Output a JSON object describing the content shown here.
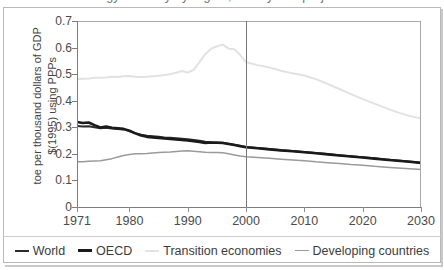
{
  "figure": {
    "title": "Energy intensity by region, history and projections",
    "title_visible_fragment": ""
  },
  "axes": {
    "y_title_line1": "toe per thousand dollars of GDP",
    "y_title_line2": "$(1995) using PPPs",
    "y_ticks": [
      "0.7",
      "0.6",
      "0.5",
      "0.4",
      "0.3",
      "0.2",
      "0.1",
      "0"
    ],
    "x_ticks": [
      "1971",
      "1980",
      "1990",
      "2000",
      "2010",
      "2020",
      "2030"
    ],
    "divider_year": "2000"
  },
  "legend": {
    "items": [
      {
        "label": "World",
        "color": "#2b2b2b"
      },
      {
        "label": "OECD",
        "color": "#1a1a1a"
      },
      {
        "label": "Transition economies",
        "color": "#e2e2e2"
      },
      {
        "label": "Developing countries",
        "color": "#9a9a9a"
      }
    ]
  },
  "chart_data": {
    "type": "line",
    "title": "Energy intensity by region, history and projections",
    "xlabel": "",
    "ylabel": "toe per thousand dollars of GDP $(1995) using PPPs",
    "xlim": [
      1971,
      2030
    ],
    "ylim": [
      0,
      0.7
    ],
    "ytick_step": 0.1,
    "grid": false,
    "legend_position": "bottom",
    "annotations": [
      {
        "type": "vline",
        "x": 2000,
        "note": "history / projection divider"
      }
    ],
    "x": [
      1971,
      1972,
      1973,
      1974,
      1975,
      1976,
      1977,
      1978,
      1979,
      1980,
      1981,
      1982,
      1983,
      1984,
      1985,
      1986,
      1987,
      1988,
      1989,
      1990,
      1991,
      1992,
      1993,
      1994,
      1995,
      1996,
      1997,
      1998,
      1999,
      2000,
      2002,
      2004,
      2006,
      2008,
      2010,
      2012,
      2014,
      2016,
      2018,
      2020,
      2022,
      2024,
      2026,
      2028,
      2030
    ],
    "series": [
      {
        "name": "World",
        "color": "#2b2b2b",
        "width": 2.0,
        "values": [
          0.305,
          0.303,
          0.304,
          0.3,
          0.296,
          0.298,
          0.295,
          0.294,
          0.292,
          0.286,
          0.278,
          0.272,
          0.268,
          0.266,
          0.264,
          0.262,
          0.261,
          0.259,
          0.257,
          0.255,
          0.252,
          0.249,
          0.246,
          0.244,
          0.243,
          0.242,
          0.238,
          0.234,
          0.23,
          0.226,
          0.222,
          0.218,
          0.214,
          0.211,
          0.207,
          0.203,
          0.199,
          0.195,
          0.191,
          0.187,
          0.183,
          0.179,
          0.175,
          0.171,
          0.167
        ]
      },
      {
        "name": "OECD",
        "color": "#1a1a1a",
        "width": 2.6,
        "values": [
          0.32,
          0.316,
          0.318,
          0.308,
          0.299,
          0.303,
          0.298,
          0.296,
          0.294,
          0.287,
          0.277,
          0.269,
          0.264,
          0.262,
          0.26,
          0.258,
          0.256,
          0.254,
          0.252,
          0.25,
          0.248,
          0.245,
          0.241,
          0.243,
          0.242,
          0.241,
          0.237,
          0.233,
          0.229,
          0.225,
          0.221,
          0.217,
          0.213,
          0.21,
          0.206,
          0.202,
          0.198,
          0.194,
          0.19,
          0.186,
          0.182,
          0.178,
          0.174,
          0.17,
          0.166
        ]
      },
      {
        "name": "Transition economies",
        "color": "#e2e2e2",
        "width": 2.0,
        "values": [
          0.482,
          0.483,
          0.484,
          0.486,
          0.486,
          0.487,
          0.49,
          0.489,
          0.492,
          0.493,
          0.49,
          0.489,
          0.49,
          0.492,
          0.494,
          0.497,
          0.5,
          0.505,
          0.512,
          0.506,
          0.516,
          0.545,
          0.575,
          0.596,
          0.605,
          0.611,
          0.596,
          0.594,
          0.572,
          0.545,
          0.534,
          0.525,
          0.513,
          0.503,
          0.495,
          0.481,
          0.463,
          0.444,
          0.425,
          0.406,
          0.389,
          0.372,
          0.356,
          0.343,
          0.333
        ]
      },
      {
        "name": "Developing countries",
        "color": "#9a9a9a",
        "width": 1.5,
        "values": [
          0.17,
          0.17,
          0.172,
          0.173,
          0.174,
          0.178,
          0.182,
          0.188,
          0.194,
          0.198,
          0.2,
          0.2,
          0.201,
          0.203,
          0.205,
          0.206,
          0.207,
          0.209,
          0.211,
          0.212,
          0.21,
          0.208,
          0.206,
          0.205,
          0.205,
          0.204,
          0.2,
          0.196,
          0.192,
          0.189,
          0.186,
          0.183,
          0.18,
          0.177,
          0.174,
          0.17,
          0.167,
          0.164,
          0.16,
          0.157,
          0.153,
          0.15,
          0.147,
          0.144,
          0.141
        ]
      }
    ]
  }
}
